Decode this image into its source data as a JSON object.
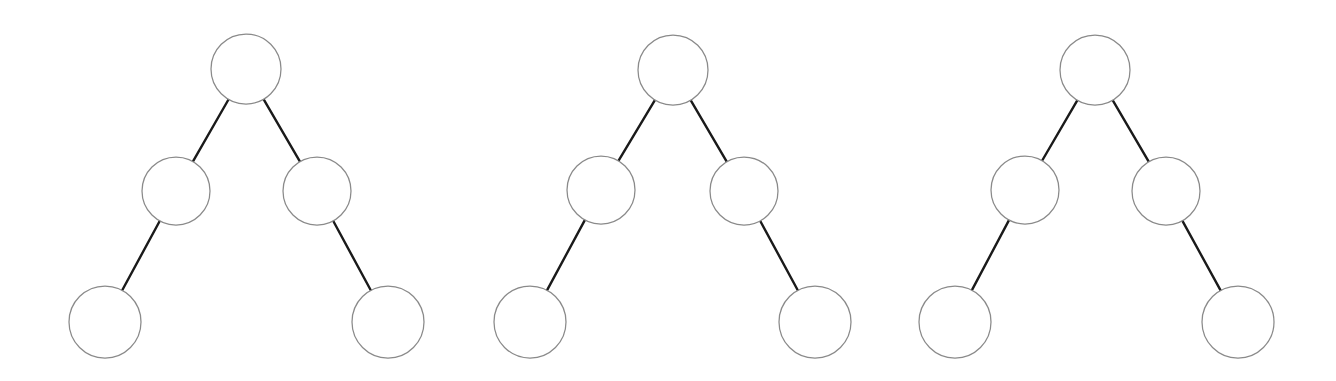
{
  "figure": {
    "title": "",
    "background_color": "#ffffff",
    "width": 1336,
    "height": 381,
    "node_fill": "#ffffff",
    "node_stroke": "#8a8a8a",
    "node_stroke_width": 1.25,
    "edge_color": "#1a1a1a",
    "edge_width": 2.4
  },
  "diagram_data": {
    "type": "diagram",
    "subtype": "binary-tree",
    "description": "Three identical five-node binary tree diagrams drawn side by side on a white background. Each tree has an unlabeled root circle, two child circles, and two leaf circles attached to the outer side of each child.",
    "tree_count": 3,
    "nodes_per_tree": 5,
    "edges_per_tree": 4,
    "depth": 3,
    "labels_present": false,
    "trees": [
      {
        "name": "tree-1",
        "index": 1,
        "nodes": [
          {
            "id": "t1-root",
            "role": "root",
            "level": 0,
            "cx": 246,
            "cy": 69,
            "r": 35,
            "label": ""
          },
          {
            "id": "t1-left-child",
            "role": "left-child",
            "level": 1,
            "cx": 176,
            "cy": 191,
            "r": 34,
            "label": ""
          },
          {
            "id": "t1-right-child",
            "role": "right-child",
            "level": 1,
            "cx": 317,
            "cy": 191,
            "r": 34,
            "label": ""
          },
          {
            "id": "t1-left-leaf",
            "role": "left-leaf",
            "level": 2,
            "cx": 105,
            "cy": 322,
            "r": 36,
            "label": ""
          },
          {
            "id": "t1-right-leaf",
            "role": "right-leaf",
            "level": 2,
            "cx": 388,
            "cy": 322,
            "r": 36,
            "label": ""
          }
        ],
        "edges": [
          {
            "id": "t1-e1",
            "from": "t1-root",
            "to": "t1-left-child"
          },
          {
            "id": "t1-e2",
            "from": "t1-root",
            "to": "t1-right-child"
          },
          {
            "id": "t1-e3",
            "from": "t1-left-child",
            "to": "t1-left-leaf"
          },
          {
            "id": "t1-e4",
            "from": "t1-right-child",
            "to": "t1-right-leaf"
          }
        ]
      },
      {
        "name": "tree-2",
        "index": 2,
        "nodes": [
          {
            "id": "t2-root",
            "role": "root",
            "level": 0,
            "cx": 673,
            "cy": 70,
            "r": 35,
            "label": ""
          },
          {
            "id": "t2-left-child",
            "role": "left-child",
            "level": 1,
            "cx": 601,
            "cy": 190,
            "r": 34,
            "label": ""
          },
          {
            "id": "t2-right-child",
            "role": "right-child",
            "level": 1,
            "cx": 744,
            "cy": 191,
            "r": 34,
            "label": ""
          },
          {
            "id": "t2-left-leaf",
            "role": "left-leaf",
            "level": 2,
            "cx": 530,
            "cy": 322,
            "r": 36,
            "label": ""
          },
          {
            "id": "t2-right-leaf",
            "role": "right-leaf",
            "level": 2,
            "cx": 815,
            "cy": 322,
            "r": 36,
            "label": ""
          }
        ],
        "edges": [
          {
            "id": "t2-e1",
            "from": "t2-root",
            "to": "t2-left-child"
          },
          {
            "id": "t2-e2",
            "from": "t2-root",
            "to": "t2-right-child"
          },
          {
            "id": "t2-e3",
            "from": "t2-left-child",
            "to": "t2-left-leaf"
          },
          {
            "id": "t2-e4",
            "from": "t2-right-child",
            "to": "t2-right-leaf"
          }
        ]
      },
      {
        "name": "tree-3",
        "index": 3,
        "nodes": [
          {
            "id": "t3-root",
            "role": "root",
            "level": 0,
            "cx": 1095,
            "cy": 70,
            "r": 35,
            "label": ""
          },
          {
            "id": "t3-left-child",
            "role": "left-child",
            "level": 1,
            "cx": 1025,
            "cy": 190,
            "r": 34,
            "label": ""
          },
          {
            "id": "t3-right-child",
            "role": "right-child",
            "level": 1,
            "cx": 1166,
            "cy": 191,
            "r": 34,
            "label": ""
          },
          {
            "id": "t3-left-leaf",
            "role": "left-leaf",
            "level": 2,
            "cx": 955,
            "cy": 322,
            "r": 36,
            "label": ""
          },
          {
            "id": "t3-right-leaf",
            "role": "right-leaf",
            "level": 2,
            "cx": 1238,
            "cy": 322,
            "r": 36,
            "label": ""
          }
        ],
        "edges": [
          {
            "id": "t3-e1",
            "from": "t3-root",
            "to": "t3-left-child"
          },
          {
            "id": "t3-e2",
            "from": "t3-root",
            "to": "t3-right-child"
          },
          {
            "id": "t3-e3",
            "from": "t3-left-child",
            "to": "t3-left-leaf"
          },
          {
            "id": "t3-e4",
            "from": "t3-right-child",
            "to": "t3-right-leaf"
          }
        ]
      }
    ]
  }
}
